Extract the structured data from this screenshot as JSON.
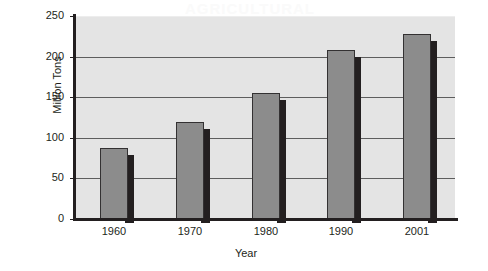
{
  "watermark": "AGRICULTURAL",
  "chart_data": {
    "type": "bar",
    "title": "",
    "xlabel": "Year",
    "ylabel": "Million Tons",
    "categories": [
      "1960",
      "1970",
      "1980",
      "1990",
      "2001"
    ],
    "values": [
      88,
      120,
      155,
      208,
      228
    ],
    "ylim": [
      0,
      250
    ],
    "ytick_labels": [
      "0",
      "50",
      "100",
      "150",
      "200",
      "250"
    ],
    "ytick_values": [
      0,
      50,
      100,
      150,
      200,
      250
    ],
    "grid": true,
    "legend": false,
    "series": [
      {
        "name": "Million Tons",
        "values": [
          88,
          120,
          155,
          208,
          228
        ]
      }
    ],
    "colors": {
      "bar_fill": "#8c8c8c",
      "bar_outline": "#333132",
      "bar_shadow": "#231f20",
      "plot_background": "#e4e4e4",
      "gridline": "#5d5d5d",
      "axis": "#231f20",
      "text": "#231f20",
      "page_background": "#ffffff"
    }
  }
}
